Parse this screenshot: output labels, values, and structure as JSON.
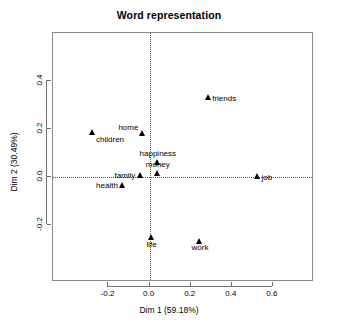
{
  "chart_data": {
    "type": "scatter",
    "title": "Word representation",
    "xlabel": "Dim 1 (59.18%)",
    "ylabel": "Dim 2 (30.49%)",
    "xlim": [
      -0.47,
      0.8
    ],
    "ylim": [
      -0.44,
      0.6
    ],
    "xticks": [
      "-0.2",
      "0.0",
      "0.2",
      "0.4",
      "0.6"
    ],
    "xtick_values": [
      -0.2,
      0.0,
      0.2,
      0.4,
      0.6
    ],
    "yticks": [
      "-0.2",
      "0.0",
      "0.2",
      "0.4"
    ],
    "ytick_values": [
      -0.2,
      0.0,
      0.2,
      0.4
    ],
    "grid": false,
    "legend": "none",
    "reference_lines": {
      "vertical_x": 0.0,
      "horizontal_y": 0.0,
      "style": "dotted"
    },
    "marker": "filled-triangle",
    "marker_color": "#000000",
    "points": [
      {
        "label": "children",
        "x": -0.28,
        "y": 0.185,
        "label_pos": "below-right"
      },
      {
        "label": "home",
        "x": -0.035,
        "y": 0.18,
        "label_pos": "above-left"
      },
      {
        "label": "friends",
        "x": 0.285,
        "y": 0.33,
        "label_pos": "right"
      },
      {
        "label": "happiness",
        "x": 0.04,
        "y": 0.06,
        "label_pos": "above"
      },
      {
        "label": "money",
        "x": 0.04,
        "y": 0.015,
        "label_pos": "above"
      },
      {
        "label": "family",
        "x": -0.045,
        "y": 0.005,
        "label_pos": "left"
      },
      {
        "label": "job",
        "x": 0.525,
        "y": 0.0,
        "label_pos": "right"
      },
      {
        "label": "health",
        "x": -0.13,
        "y": -0.035,
        "label_pos": "left"
      },
      {
        "label": "life",
        "x": 0.01,
        "y": -0.255,
        "label_pos": "below"
      },
      {
        "label": "work",
        "x": 0.245,
        "y": -0.27,
        "label_pos": "below"
      }
    ]
  }
}
